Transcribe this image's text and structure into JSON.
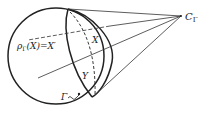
{
  "diagram": {
    "labels": {
      "apex": "C",
      "apex_sub": "Γ",
      "projection": "ρ",
      "projection_sub": "Γ",
      "projection_rest": "(X)=X′",
      "region_x": "X",
      "region_y": "Y",
      "curve": "Γ"
    },
    "colors": {
      "stroke": "#222222",
      "background": "#ffffff"
    }
  }
}
